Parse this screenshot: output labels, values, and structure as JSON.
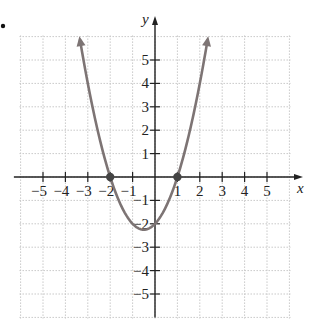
{
  "chart_data": {
    "type": "line",
    "title": "",
    "xlabel": "x",
    "ylabel": "y",
    "xlim": [
      -6,
      6
    ],
    "ylim": [
      -6,
      6
    ],
    "grid": true,
    "grid_style": "dotted",
    "x_ticks": [
      -5,
      -4,
      -3,
      -2,
      -1,
      1,
      2,
      3,
      4,
      5
    ],
    "y_ticks": [
      -5,
      -4,
      -3,
      -2,
      -1,
      1,
      2,
      3,
      4,
      5
    ],
    "x_tick_labels": [
      "-5",
      "-4",
      "-3",
      "-2",
      "-1",
      "1",
      "2",
      "3",
      "4",
      "5"
    ],
    "y_tick_labels": [
      "-5",
      "-4",
      "-3",
      "-2",
      "-1",
      "1",
      "2",
      "3",
      "4",
      "5"
    ],
    "series": [
      {
        "name": "y = x^2 + x - 2",
        "function": "x^2 + x - 2",
        "x": [
          -3.0,
          -2.5,
          -2.0,
          -1.5,
          -1.0,
          -0.5,
          0.0,
          0.5,
          1.0,
          1.5,
          2.0,
          2.5
        ],
        "y": [
          4.0,
          1.75,
          0.0,
          -1.25,
          -2.0,
          -2.25,
          -2.0,
          -1.25,
          0.0,
          1.75,
          4.0,
          6.75
        ],
        "arrows_at_ends": true,
        "color": "#7d7474"
      }
    ],
    "highlighted_points": [
      {
        "x": -2,
        "y": 0,
        "label": "x-intercept"
      },
      {
        "x": 1,
        "y": 0,
        "label": "x-intercept"
      }
    ],
    "annotations": [
      "bullet marker at top-left"
    ]
  },
  "labels": {
    "x_axis": "x",
    "y_axis": "y"
  },
  "colors": {
    "curve": "#7d7474",
    "axis": "#222222",
    "grid": "#c8c8c8",
    "point": "#444444"
  }
}
